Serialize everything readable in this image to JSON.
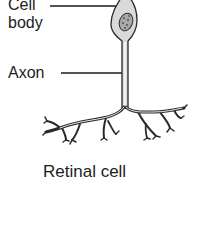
{
  "diagram": {
    "title": "Retinal cell",
    "labels": [
      {
        "id": "cell-body",
        "text_line1": "Cell",
        "text_line2": "body"
      },
      {
        "id": "axon",
        "text": "Axon"
      }
    ],
    "caption": "Retinal cell",
    "colors": {
      "outline": "#2a2a2a",
      "cell_fill": "#d9d9d9",
      "nucleus_fill": "#a8a8a8",
      "leader_line": "#1a1a1a"
    }
  }
}
